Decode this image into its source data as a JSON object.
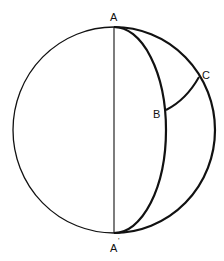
{
  "diagram": {
    "type": "spherical-geometry",
    "labels": {
      "A": "A",
      "A_prime": "A",
      "A_prime_mark": "'",
      "B": "B",
      "C": "C"
    },
    "colors": {
      "stroke": "#111111",
      "background": "#ffffff"
    }
  }
}
